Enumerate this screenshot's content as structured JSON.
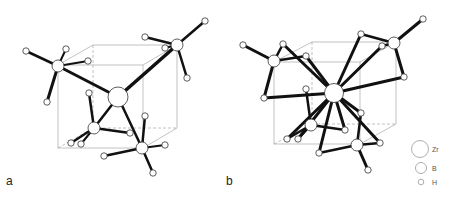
{
  "figure": {
    "panels": [
      {
        "label": "a"
      },
      {
        "label": "b"
      }
    ],
    "legend": [
      {
        "symbol": "large-circle",
        "label": "Zr"
      },
      {
        "symbol": "medium-circle",
        "label": "B"
      },
      {
        "symbol": "small-circle",
        "label": "H"
      }
    ]
  }
}
